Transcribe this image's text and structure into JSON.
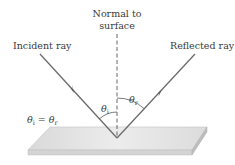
{
  "labels": {
    "normal_line1": "Normal to",
    "normal_line2": "surface",
    "incident": "Incident ray",
    "reflected": "Reflected ray",
    "theta": "θ",
    "sub_i": "i",
    "sub_r": "r",
    "equation_eq": " = "
  },
  "colors": {
    "ray": "#6b6b6b",
    "normal": "#555555",
    "text": "#3a3a3a",
    "slab_top": "#e2e2e2",
    "slab_front": "#d0d0d0",
    "slab_side": "#bdbdbd"
  },
  "geometry": {
    "reflection_point": [
      117,
      138
    ],
    "incident_start": [
      40,
      54
    ],
    "reflected_end": [
      195,
      54
    ],
    "normal_top_y": 34
  }
}
